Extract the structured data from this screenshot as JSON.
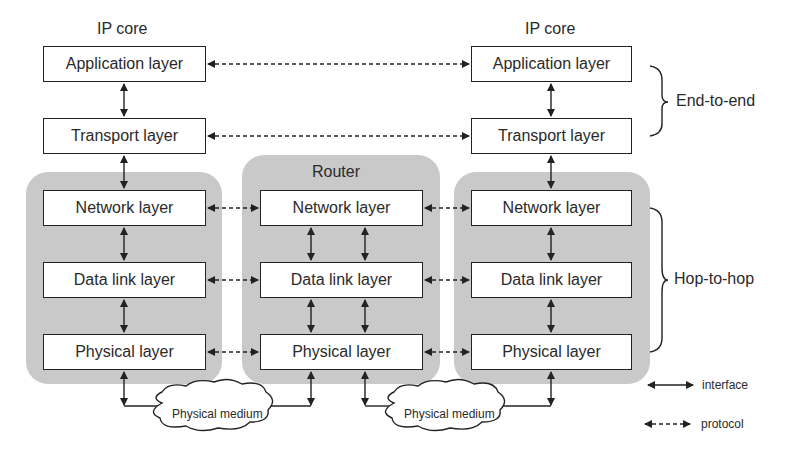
{
  "nodes": {
    "left": {
      "title": "IP core",
      "layers": [
        "Application layer",
        "Transport layer",
        "Network layer",
        "Data link layer",
        "Physical layer"
      ]
    },
    "router": {
      "title": "Router",
      "layers": [
        "Network layer",
        "Data link layer",
        "Physical layer"
      ]
    },
    "right": {
      "title": "IP core",
      "layers": [
        "Application layer",
        "Transport layer",
        "Network layer",
        "Data link layer",
        "Physical layer"
      ]
    }
  },
  "media": [
    "Physical medium",
    "Physical medium"
  ],
  "braces": {
    "end_to_end": "End-to-end",
    "hop_to_hop": "Hop-to-hop"
  },
  "legend": {
    "interface": "interface",
    "protocol": "protocol"
  },
  "colors": {
    "panel": "#c9c9c9",
    "line": "#222222",
    "box_fill": "#ffffff"
  }
}
